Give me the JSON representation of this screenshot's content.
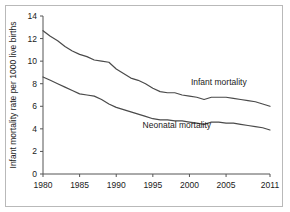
{
  "chart_data": {
    "type": "line",
    "title": "",
    "xlabel": "",
    "ylabel": "Infant mortality rate per 1000 live births",
    "xlim": [
      1980,
      2011
    ],
    "ylim": [
      0,
      14
    ],
    "ytick_values": [
      0,
      2,
      4,
      6,
      8,
      10,
      12,
      14
    ],
    "ytick_labels": [
      "0",
      "2",
      "4",
      "6",
      "8",
      "10",
      "12",
      "14"
    ],
    "xtick_values": [
      1980,
      1985,
      1990,
      1995,
      2000,
      2005,
      2011
    ],
    "xtick_labels": [
      "1980",
      "1985",
      "1990",
      "1995",
      "2000",
      "2005",
      "2011"
    ],
    "grid": false,
    "legend_position": "inline-annotations",
    "line_color": "#4a4a4a",
    "frame_color": "#b9b9b9",
    "x": [
      1980,
      1981,
      1982,
      1983,
      1984,
      1985,
      1986,
      1987,
      1988,
      1989,
      1990,
      1991,
      1992,
      1993,
      1994,
      1995,
      1996,
      1997,
      1998,
      1999,
      2000,
      2001,
      2002,
      2003,
      2004,
      2005,
      2006,
      2007,
      2008,
      2009,
      2010,
      2011
    ],
    "series": [
      {
        "name": "Infant mortality",
        "label_x": 2000.2,
        "label_y": 7.85,
        "values": [
          12.7,
          12.2,
          11.8,
          11.3,
          10.9,
          10.6,
          10.4,
          10.1,
          10.0,
          9.9,
          9.3,
          8.9,
          8.5,
          8.3,
          8.0,
          7.6,
          7.3,
          7.2,
          7.2,
          7.0,
          6.9,
          6.8,
          6.6,
          6.8,
          6.8,
          6.8,
          6.7,
          6.6,
          6.5,
          6.4,
          6.2,
          6.0
        ]
      },
      {
        "name": "Neonatal mortality",
        "label_x": 1993.6,
        "label_y": 4.05,
        "values": [
          8.6,
          8.3,
          8.0,
          7.7,
          7.4,
          7.1,
          7.0,
          6.9,
          6.6,
          6.2,
          5.9,
          5.7,
          5.5,
          5.3,
          5.1,
          4.9,
          4.8,
          4.8,
          4.7,
          4.7,
          4.6,
          4.5,
          4.4,
          4.6,
          4.6,
          4.5,
          4.5,
          4.4,
          4.3,
          4.2,
          4.1,
          3.9
        ]
      }
    ]
  }
}
